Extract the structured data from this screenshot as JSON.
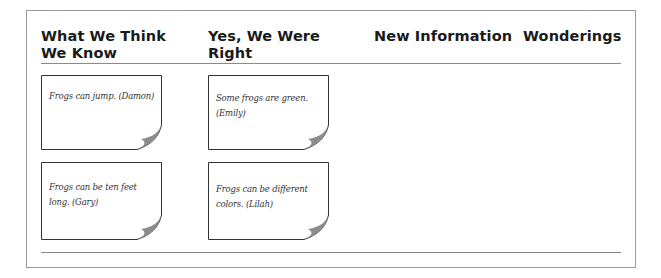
{
  "chart": {
    "columns": [
      {
        "header_line1": "What We Think",
        "header_line2": "We Know"
      },
      {
        "header_line1": "Yes, We Were",
        "header_line2": "Right"
      },
      {
        "header_line1": "New Information",
        "header_line2": ""
      },
      {
        "header_line1": "Wonderings",
        "header_line2": ""
      }
    ],
    "notes": {
      "what_we_think_we_know": [
        {
          "text": "Frogs can jump. (Damon)"
        },
        {
          "text": "Frogs can be ten feet long. (Gary)"
        }
      ],
      "yes_we_were_right": [
        {
          "text": "Some frogs are green. (Emily)"
        },
        {
          "text": "Frogs can be different colors. (Lilah)"
        }
      ],
      "new_information": [],
      "wonderings": []
    }
  },
  "colors": {
    "frame_border": "#9a9a9a",
    "rule": "#8a8a8a",
    "note_border": "#333333",
    "curl_shadow": "#8c8c8c",
    "header_text": "#1a1a1a"
  }
}
